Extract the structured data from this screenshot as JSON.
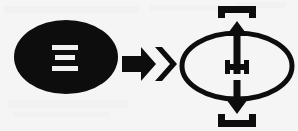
{
  "figure": {
    "caption": "",
    "background_color": "#f5f5f5",
    "ink_color": "#0d0d0d",
    "glyph_color": "#f2f2f2",
    "panels": [
      {
        "id": "left",
        "name": "filled-ellipse-panel",
        "shape": "solid-ellipse",
        "inner_symbol": "Ξ",
        "inner_symbol_name": "xi-symbol",
        "inner_symbol_bars": 3,
        "fill": "#0d0d0d",
        "symbol_fill": "#f2f2f2"
      },
      {
        "id": "middle",
        "name": "transformation-arrow-panel",
        "shape": "double-chevron-arrow",
        "direction": "right",
        "fill": "#0d0d0d"
      },
      {
        "id": "right",
        "name": "outline-ellipse-panel",
        "shape": "outline-ellipse",
        "stroke": "#0d0d0d",
        "inner_symbol": "I",
        "inner_symbol_name": "i-beam-symbol",
        "annotations": [
          {
            "name": "top-bracket",
            "glyph": "⊓",
            "position": "top"
          },
          {
            "name": "up-arrow",
            "glyph": "↑",
            "position": "top-center"
          },
          {
            "name": "i-beam",
            "glyph": "I",
            "position": "center"
          },
          {
            "name": "down-arrow",
            "glyph": "↓",
            "position": "bottom-center"
          },
          {
            "name": "bottom-bracket",
            "glyph": "⊔",
            "position": "bottom"
          }
        ]
      }
    ]
  },
  "labels": {
    "left_alt": "Solid black ellipse containing white Xi symbol",
    "arrow_alt": "Thick rightward double-chevron arrow",
    "right_alt": "Outlined ellipse with vertical up and down arrows, top and bottom brackets, and a central I-beam"
  }
}
